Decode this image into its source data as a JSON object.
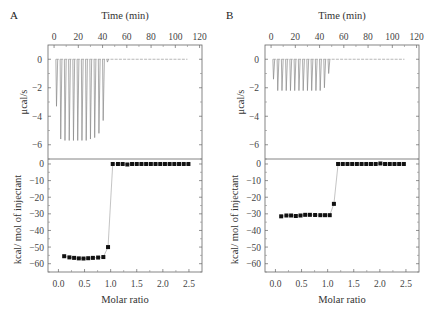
{
  "chart_data": [
    {
      "panel": "A",
      "type": "line",
      "subplots": [
        {
          "name": "thermogram",
          "title": "",
          "xlabel": "Time (min)",
          "ylabel": "μcal/s",
          "x_ticks": [
            0,
            20,
            40,
            60,
            80,
            100,
            120
          ],
          "y_ticks": [
            0,
            -2,
            -4,
            -6
          ],
          "xlim": [
            -5,
            122
          ],
          "ylim": [
            -7,
            1
          ],
          "baseline": 0,
          "baseline_end_min": 110,
          "injection_peaks": [
            {
              "time": 2,
              "min": -3.3
            },
            {
              "time": 5.5,
              "min": -5.6
            },
            {
              "time": 9,
              "min": -5.7
            },
            {
              "time": 12.5,
              "min": -5.7
            },
            {
              "time": 16,
              "min": -5.7
            },
            {
              "time": 19.5,
              "min": -5.7
            },
            {
              "time": 23,
              "min": -5.7
            },
            {
              "time": 26.5,
              "min": -5.7
            },
            {
              "time": 30,
              "min": -5.6
            },
            {
              "time": 33.5,
              "min": -5.5
            },
            {
              "time": 37,
              "min": -5.2
            },
            {
              "time": 40.5,
              "min": -4.3
            },
            {
              "time": 44,
              "min": -0.2
            }
          ]
        },
        {
          "name": "binding_isotherm",
          "xlabel": "Molar ratio",
          "ylabel": "kcal/ mol of injectant",
          "x_ticks": [
            "0.0",
            "0.5",
            "1.0",
            "1.5",
            "2.0",
            "2.5"
          ],
          "y_ticks": [
            0,
            -10,
            -20,
            -30,
            -40,
            -50,
            -60
          ],
          "xlim": [
            -0.2,
            2.75
          ],
          "ylim": [
            -65,
            3
          ],
          "x": [
            0.11,
            0.21,
            0.3,
            0.39,
            0.48,
            0.57,
            0.66,
            0.76,
            0.86,
            0.95,
            1.04,
            1.14,
            1.23,
            1.32,
            1.41,
            1.5,
            1.59,
            1.68,
            1.77,
            1.86,
            1.95,
            2.04,
            2.13,
            2.22,
            2.31,
            2.4,
            2.49
          ],
          "y": [
            -55.5,
            -56.2,
            -56.5,
            -56.8,
            -56.9,
            -56.7,
            -56.5,
            -56.3,
            -56,
            -50,
            0,
            0,
            0,
            -0.3,
            0,
            0,
            0,
            0,
            0,
            0,
            0,
            0,
            0,
            0,
            0,
            0,
            0
          ]
        }
      ]
    },
    {
      "panel": "B",
      "type": "line",
      "subplots": [
        {
          "name": "thermogram",
          "xlabel": "Time (min)",
          "ylabel": "μcal/s",
          "x_ticks": [
            0,
            20,
            40,
            60,
            80,
            100,
            120
          ],
          "y_ticks": [
            0,
            -2,
            -4,
            -6
          ],
          "xlim": [
            -5,
            122
          ],
          "ylim": [
            -7,
            1
          ],
          "baseline": 0,
          "baseline_end_min": 110,
          "injection_peaks": [
            {
              "time": 2,
              "min": -1.4
            },
            {
              "time": 5.5,
              "min": -2.2
            },
            {
              "time": 9,
              "min": -2.2
            },
            {
              "time": 12.5,
              "min": -2.2
            },
            {
              "time": 16,
              "min": -2.2
            },
            {
              "time": 19.5,
              "min": -2.2
            },
            {
              "time": 23,
              "min": -2.2
            },
            {
              "time": 26.5,
              "min": -2.2
            },
            {
              "time": 30,
              "min": -2.2
            },
            {
              "time": 33.5,
              "min": -2.2
            },
            {
              "time": 37,
              "min": -2.2
            },
            {
              "time": 40.5,
              "min": -2.2
            },
            {
              "time": 44,
              "min": -2.0
            },
            {
              "time": 47.5,
              "min": -1.0
            }
          ]
        },
        {
          "name": "binding_isotherm",
          "xlabel": "Molar ratio",
          "ylabel": "kcal/ mol of injectant",
          "x_ticks": [
            "0.0",
            "0.5",
            "1.0",
            "1.5",
            "2.0",
            "2.5"
          ],
          "y_ticks": [
            0,
            -10,
            -20,
            -30,
            -40,
            -50,
            -60
          ],
          "xlim": [
            -0.2,
            2.75
          ],
          "ylim": [
            -65,
            3
          ],
          "x": [
            0.11,
            0.21,
            0.3,
            0.39,
            0.48,
            0.57,
            0.66,
            0.76,
            0.86,
            0.95,
            1.04,
            1.12,
            1.2,
            1.29,
            1.38,
            1.47,
            1.56,
            1.65,
            1.74,
            1.83,
            1.92,
            2.01,
            2.1,
            2.19,
            2.28,
            2.37,
            2.46
          ],
          "y": [
            -31.5,
            -31,
            -31,
            -31.3,
            -31,
            -30.6,
            -30.6,
            -30.7,
            -30.8,
            -30.8,
            -30.8,
            -24,
            0,
            0,
            0,
            0,
            0,
            0,
            0,
            0,
            0,
            0.3,
            0,
            0,
            0,
            0,
            0
          ]
        }
      ]
    }
  ],
  "labels": {
    "panel_a": "A",
    "panel_b": "B",
    "time_axis": "Time (min)",
    "power_axis": "μcal/s",
    "heat_axis": "kcal/ mol of injectant",
    "molar_axis": "Molar ratio"
  }
}
